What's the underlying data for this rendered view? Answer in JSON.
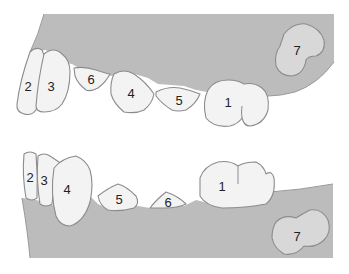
{
  "diagram": {
    "type": "dental-arch-diagram",
    "colors": {
      "gum": "#bcbcbc",
      "tooth_fill": "#f3f3f3",
      "unerupted_tooth_fill": "#d8d8d8",
      "outline": "#8c8c8c",
      "label": "#222222"
    },
    "upper_jaw": {
      "teeth": [
        {
          "label": "2"
        },
        {
          "label": "3"
        },
        {
          "label": "6"
        },
        {
          "label": "4"
        },
        {
          "label": "5"
        },
        {
          "label": "1"
        },
        {
          "label": "7"
        }
      ]
    },
    "lower_jaw": {
      "teeth": [
        {
          "label": "2"
        },
        {
          "label": "3"
        },
        {
          "label": "4"
        },
        {
          "label": "5"
        },
        {
          "label": "6"
        },
        {
          "label": "1"
        },
        {
          "label": "7"
        }
      ]
    }
  }
}
